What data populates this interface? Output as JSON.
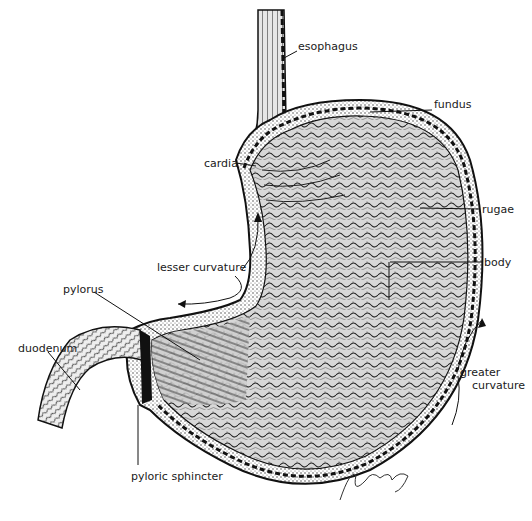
{
  "diagram": {
    "colors": {
      "ink": "#111111",
      "background": "#ffffff"
    },
    "labels": [
      {
        "id": "esophagus",
        "text": "esophagus",
        "x": 298,
        "y": 46
      },
      {
        "id": "fundus",
        "text": "fundus",
        "x": 434,
        "y": 104
      },
      {
        "id": "cardia",
        "text": "cardia",
        "x": 206,
        "y": 158
      },
      {
        "id": "rugae",
        "text": "rugae",
        "x": 482,
        "y": 203
      },
      {
        "id": "body",
        "text": "body",
        "x": 484,
        "y": 256
      },
      {
        "id": "lesser_curvature",
        "text": "lesser curvature",
        "x": 157,
        "y": 261
      },
      {
        "id": "pylorus",
        "text": "pylorus",
        "x": 63,
        "y": 283
      },
      {
        "id": "duodenum",
        "text": "duodenum",
        "x": 18,
        "y": 342
      },
      {
        "id": "greater_curvature_1",
        "text": "greater",
        "x": 460,
        "y": 366
      },
      {
        "id": "greater_curvature_2",
        "text": "curvature",
        "x": 472,
        "y": 378
      },
      {
        "id": "pyloric_sphincter",
        "text": "pyloric sphincter",
        "x": 131,
        "y": 470
      }
    ],
    "signature": "Joe Yuhasz"
  }
}
